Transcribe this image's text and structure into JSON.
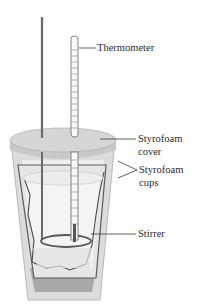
{
  "diagram": {
    "type": "coffee-cup calorimeter",
    "labels": {
      "thermometer": "Thermometer",
      "cover_line1": "Styrofoam",
      "cover_line2": "cover",
      "cups_line1": "Styrofoam",
      "cups_line2": "cups",
      "stirrer": "Stirrer"
    },
    "colors": {
      "cup_outer": "#d9d9d9",
      "cup_inner": "#ececec",
      "cup_dark": "#9a9a9a",
      "lid": "#d4d4d4",
      "stirrer": "#6a6a6a",
      "line": "#3a3a3a"
    }
  }
}
